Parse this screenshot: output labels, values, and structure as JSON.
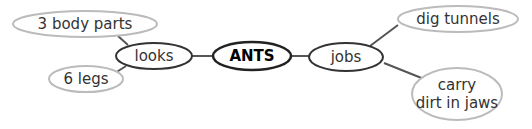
{
  "diagram": {
    "type": "concept map",
    "center": {
      "label": "ANTS"
    },
    "branches": [
      {
        "label": "looks",
        "details": [
          {
            "label": "3 body parts"
          },
          {
            "label": "6 legs"
          }
        ]
      },
      {
        "label": "jobs",
        "details": [
          {
            "label": "dig tunnels"
          },
          {
            "label": "carry",
            "label2": "dirt in jaws"
          }
        ]
      }
    ]
  },
  "colors": {
    "center_stroke": "#222222",
    "branch_stroke": "#333333",
    "detail_stroke": "#bbbbbb",
    "connector": "#555555",
    "text": "#333333"
  }
}
